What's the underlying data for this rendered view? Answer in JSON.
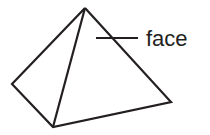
{
  "diagram": {
    "labels": [
      {
        "id": "face",
        "text": "face"
      }
    ],
    "colors": {
      "stroke": "#231f20",
      "background": "#ffffff"
    },
    "vertices": {
      "apex": [
        85,
        8
      ],
      "left": [
        12,
        84
      ],
      "front": [
        53,
        127
      ],
      "right": [
        171,
        102
      ]
    }
  }
}
